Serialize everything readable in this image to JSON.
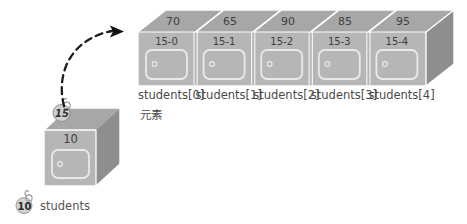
{
  "diagram": {
    "title_cn": "元素",
    "array": {
      "name": "students",
      "cells": [
        {
          "top_value": "70",
          "front_id": "15-0",
          "caption": "students[0]"
        },
        {
          "top_value": "65",
          "front_id": "15-1",
          "caption": "students[1]"
        },
        {
          "top_value": "90",
          "front_id": "15-2",
          "caption": "students[2]"
        },
        {
          "top_value": "85",
          "front_id": "15-3",
          "caption": "students[3]"
        },
        {
          "top_value": "95",
          "front_id": "15-4",
          "caption": "students[4]"
        }
      ]
    },
    "reference_cube": {
      "front_value": "10",
      "tag_value": "15"
    },
    "legend": {
      "tag_value": "10",
      "label": "students"
    },
    "colors": {
      "box_top": "#a8a8a8",
      "box_front": "#b5b5b5",
      "box_side": "#8f8f8f",
      "outline": "#ffffff",
      "text": "#3f3f3f",
      "arrow": "#1a1a1a"
    }
  }
}
